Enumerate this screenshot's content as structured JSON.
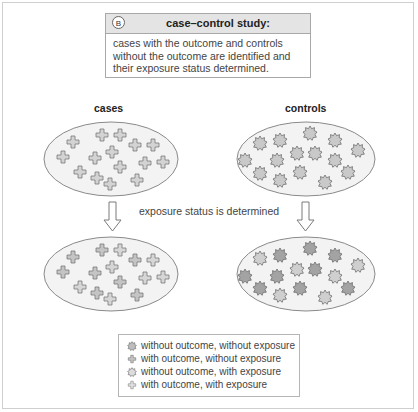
{
  "header": {
    "badge": "B",
    "title": "case–control study:",
    "description": "cases with the outcome and controls without the outcome are identified and their exposure status determined."
  },
  "columns": {
    "cases_label": "cases",
    "controls_label": "controls"
  },
  "process": {
    "arrow_text": "exposure status is determined"
  },
  "colors": {
    "frame_border": "#cfcfcf",
    "ellipse_fill": "#f3f3f3",
    "ellipse_stroke": "#8a8a8a",
    "shape_unexposed": "#cfcfcf",
    "shape_exposed": "#9e9e9e",
    "header_bar": "#e4e4e4"
  },
  "legend": {
    "items": [
      {
        "icon": "star-icon",
        "shade": "light",
        "label": "without outcome, without exposure"
      },
      {
        "icon": "cross-icon",
        "shade": "light",
        "label": "with outcome, without exposure"
      },
      {
        "icon": "star-icon",
        "shade": "dark",
        "label": "without outcome, with exposure"
      },
      {
        "icon": "cross-icon",
        "shade": "dark",
        "label": "with outcome, with exposure"
      }
    ]
  }
}
